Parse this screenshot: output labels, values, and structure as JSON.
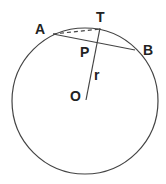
{
  "diagram": {
    "type": "geometry",
    "colors": {
      "stroke": "#444444",
      "text": "#222222",
      "background": "#ffffff"
    },
    "circle": {
      "cx": 85,
      "cy": 101,
      "r": 73
    },
    "points": {
      "A": {
        "label": "A",
        "x": 53,
        "y": 34
      },
      "B": {
        "label": "B",
        "x": 135,
        "y": 50
      },
      "T": {
        "label": "T",
        "x": 100,
        "y": 29
      },
      "P": {
        "label": "P",
        "x": 96,
        "y": 42
      },
      "O": {
        "label": "O",
        "x": 86,
        "y": 100
      }
    },
    "segments": [
      {
        "name": "chord-AB",
        "from": "A",
        "to": "B",
        "style": "solid"
      },
      {
        "name": "segment-AT",
        "from": "A",
        "to": "T",
        "style": "dashed"
      },
      {
        "name": "radius-OT",
        "from": "O",
        "to": "T",
        "style": "solid"
      }
    ],
    "labels": {
      "A": "A",
      "B": "B",
      "T": "T",
      "P": "P",
      "O": "O",
      "r": "r"
    }
  }
}
